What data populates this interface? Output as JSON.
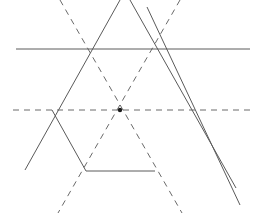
{
  "figure": {
    "canvas": {
      "width": 258,
      "height": 213,
      "background": "#ffffff"
    },
    "style": {
      "solid_color": "#5a5a5a",
      "dashed_color": "#6a6a6a",
      "dot_color": "#1a1a1a",
      "stroke_width": 1,
      "dash_pattern": "6 5"
    },
    "center": {
      "label": "center",
      "x": 120,
      "y": 110,
      "radius": 2.2
    },
    "hexagon_vertices": [
      {
        "label": "left",
        "x": 52,
        "y": 110
      },
      {
        "label": "top-left",
        "x": 86,
        "y": 49
      },
      {
        "label": "top-right",
        "x": 155,
        "y": 49
      },
      {
        "label": "right",
        "x": 187,
        "y": 110
      },
      {
        "label": "bottom-right",
        "x": 155,
        "y": 171
      },
      {
        "label": "bottom-left",
        "x": 86,
        "y": 171
      }
    ],
    "solid_lines": [
      {
        "name": "top-edge-extended",
        "x1": 16,
        "y1": 49,
        "x2": 250,
        "y2": 49
      },
      {
        "name": "upper-left-edge-extended",
        "x1": 120,
        "y1": 0,
        "x2": 25,
        "y2": 170
      },
      {
        "name": "upper-right-edge-extended",
        "x1": 130,
        "y1": 0,
        "x2": 236,
        "y2": 188
      },
      {
        "name": "lower-right-edge-extended",
        "x1": 147,
        "y1": 7,
        "x2": 240,
        "y2": 205
      },
      {
        "name": "bottom-edge",
        "x1": 86,
        "y1": 171,
        "x2": 155,
        "y2": 171
      },
      {
        "name": "lower-left-edge",
        "x1": 52,
        "y1": 110,
        "x2": 86,
        "y2": 171
      }
    ],
    "dashed_lines": [
      {
        "name": "horizontal-diagonal",
        "x1": 13,
        "y1": 110,
        "x2": 250,
        "y2": 110
      },
      {
        "name": "diagonal-top-left-to-bottom-right",
        "x1": 60,
        "y1": 0,
        "x2": 182,
        "y2": 213
      },
      {
        "name": "diagonal-top-right-to-bottom-left",
        "x1": 180,
        "y1": 0,
        "x2": 58,
        "y2": 213
      }
    ]
  }
}
